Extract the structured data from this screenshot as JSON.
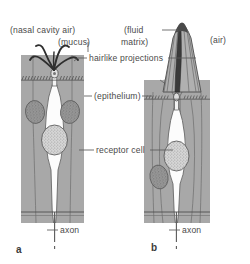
{
  "figure": {
    "background": "#ffffff",
    "ink": "#4a4a4a",
    "epithelium_fill": "#a8a8a8",
    "cell_fill": "#fdfdfd",
    "nucleus_fill": "#8a8a8a",
    "sensillum_fill": "#b5b5b5",
    "labels": {
      "nasal_cavity_air": "(nasal cavity air)",
      "mucus": "(mucus)",
      "hairlike_projections": "hairlike projections",
      "epithelium": "(epithelium)",
      "receptor_cell": "receptor cell",
      "fluid_matrix_line1": "(fluid",
      "fluid_matrix_line2": "matrix)",
      "air": "(air)",
      "axon_a": "axon",
      "axon_b": "axon"
    },
    "panels": [
      {
        "id": "a",
        "label": "a",
        "type": "vertebrate-olfactory-epithelium"
      },
      {
        "id": "b",
        "label": "b",
        "type": "insect-sensillum"
      }
    ]
  }
}
